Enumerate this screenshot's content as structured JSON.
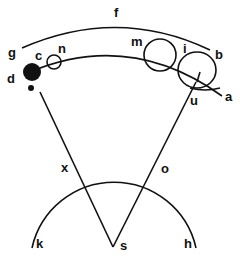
{
  "diagram": {
    "type": "geometric-astronomy-diagram",
    "labels": {
      "f": "f",
      "g": "g",
      "c": "c",
      "n": "n",
      "d": "d",
      "e": "e",
      "m": "m",
      "i": "i",
      "b": "b",
      "u": "u",
      "a": "a",
      "x": "x",
      "o": "o",
      "k": "k",
      "s": "s",
      "h": "h"
    },
    "colors": {
      "ink": "#111111",
      "background": "#ffffff"
    }
  }
}
